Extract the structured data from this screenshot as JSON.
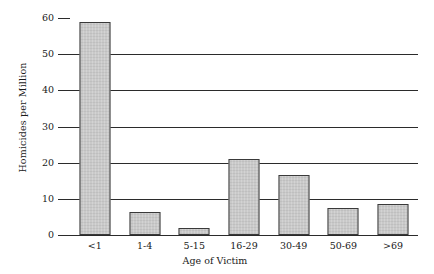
{
  "chart_data": {
    "type": "bar",
    "title": "",
    "xlabel": "Age of Victim",
    "ylabel": "Homicides per Million",
    "categories": [
      "<1",
      "1-4",
      "5-15",
      "16-29",
      "30-49",
      "50-69",
      ">69"
    ],
    "values": [
      59,
      6.5,
      2,
      21,
      16.5,
      7.5,
      8.5
    ],
    "ylim": [
      0,
      60
    ],
    "yticks": [
      0,
      10,
      20,
      30,
      40,
      50,
      60
    ],
    "ytick_labels": [
      "0",
      "10",
      "20",
      "30",
      "40",
      "50",
      "60"
    ],
    "gridlines_at": [
      10,
      20,
      30,
      40,
      50
    ],
    "grid": true,
    "legend": "none",
    "bar_color": "#c9c9c9",
    "bar_border_color": "#3a3a3a",
    "axis_color": "#2b2b2b"
  }
}
